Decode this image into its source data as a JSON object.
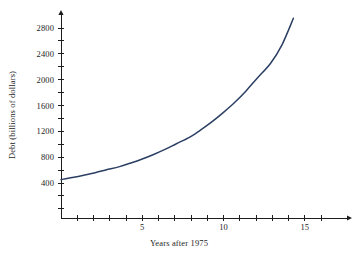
{
  "chart_data": {
    "type": "line",
    "title": "",
    "xlabel": "Years after 1975",
    "ylabel": "Debt (billions of dollars)",
    "xlim": [
      -0.45,
      16.2
    ],
    "ylim": [
      0,
      3050
    ],
    "grid": false,
    "legend": null,
    "line_color": "#2b3f63",
    "axis_color": "#1d1d1d",
    "x_ticks": [
      1,
      2,
      3,
      4,
      5,
      6,
      7,
      8,
      9,
      10,
      11,
      12,
      13,
      14,
      15,
      16
    ],
    "x_tick_labels": [
      {
        "value": 5,
        "label": "5"
      },
      {
        "value": 10,
        "label": "10"
      },
      {
        "value": 15,
        "label": "15"
      }
    ],
    "y_ticks": [
      200,
      400,
      600,
      800,
      1000,
      1200,
      1400,
      1600,
      1800,
      2000,
      2200,
      2400,
      2600,
      2800
    ],
    "y_tick_labels": [
      {
        "value": 2800,
        "label": "2800"
      },
      {
        "value": 2400,
        "label": "2400"
      },
      {
        "value": 2000,
        "label": "2000"
      },
      {
        "value": 1600,
        "label": "1600"
      },
      {
        "value": 1200,
        "label": "1200"
      },
      {
        "value": 800,
        "label": "800"
      },
      {
        "value": 400,
        "label": "400"
      }
    ],
    "series": [
      {
        "name": "National debt",
        "x": [
          0.0,
          0.7,
          1.4,
          2.1,
          2.8,
          3.6,
          4.3,
          5.0,
          5.7,
          6.4,
          7.1,
          7.9,
          8.6,
          9.3,
          10.0,
          10.7,
          11.4,
          12.1,
          12.9,
          13.6,
          14.3
        ],
        "y": [
          452,
          484,
          520,
          560,
          604,
          654,
          710,
          772,
          842,
          920,
          1008,
          1108,
          1222,
          1350,
          1494,
          1650,
          1830,
          2030,
          2255,
          2540,
          2950
        ]
      }
    ]
  }
}
